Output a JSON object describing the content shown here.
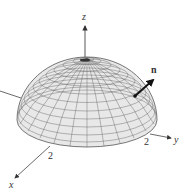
{
  "figure": {
    "type": "3d-surface-diagram",
    "surface": "upper hemisphere",
    "colors": {
      "surface_fill": "#e6e6e6",
      "mesh": "#555555",
      "axes": "#444444",
      "vector": "#111111"
    }
  },
  "axes": {
    "z_label": "z",
    "y_label": "y",
    "x_label": "x",
    "y_tick": "2",
    "x_tick": "2"
  },
  "vector": {
    "label": "n"
  }
}
